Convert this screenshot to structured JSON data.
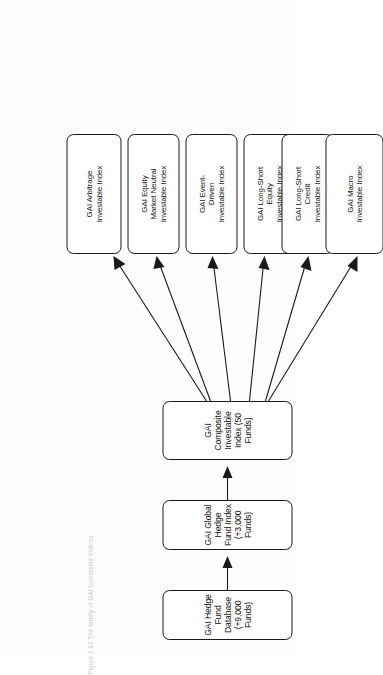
{
  "figure": {
    "caption": "Figure 3.13  The family of GAI Investable Indices",
    "orientation": "rotated-90-ccw",
    "colors": {
      "stroke": "#1a1a1a",
      "node_fill": "#ffffff",
      "page_background": "#fdfdfd",
      "caption_text": "#c9c9c9"
    }
  },
  "chain": [
    {
      "id": "database",
      "label": "GAI Hedge Fund Database (+9,000 Funds)"
    },
    {
      "id": "global-index",
      "label": "GAI Global Hedge Fund Index (+3,000 Funds)"
    },
    {
      "id": "composite-index",
      "label": "GAI Composite Investable Index (50 Funds)"
    }
  ],
  "leaves": [
    {
      "id": "arbitrage",
      "lines": [
        "GAI Arbitrage",
        "Investable Index"
      ]
    },
    {
      "id": "equity-market-neutral",
      "lines": [
        "GAI Equity",
        "Market Neutral",
        "Investable Index"
      ]
    },
    {
      "id": "event-driven",
      "lines": [
        "GAI Event-",
        "Driven",
        "Investable Index"
      ]
    },
    {
      "id": "long-short-equity",
      "lines": [
        "GAI Long-Short",
        "Equity",
        "Investable Index"
      ]
    },
    {
      "id": "long-short-credit",
      "lines": [
        "GAI Long-Short",
        "Credit",
        "Investable Index"
      ]
    },
    {
      "id": "macro",
      "lines": [
        "GAI Macro",
        "Investable Index"
      ]
    }
  ]
}
